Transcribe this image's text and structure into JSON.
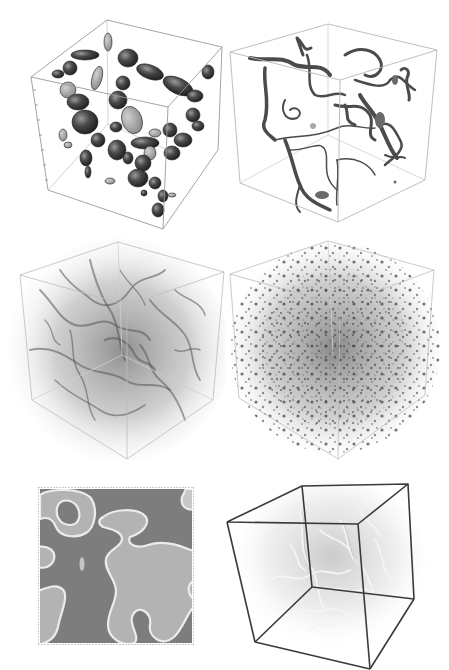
{
  "figure": {
    "background": "#ffffff",
    "panels": [
      {
        "id": "a",
        "kind": "3d-isosurface-blobs",
        "description": "Isosurfaces of localized blob structures inside a wireframe cube",
        "edge_color": "#9a9a9a",
        "fill_color": "#3a3a3a"
      },
      {
        "id": "b",
        "kind": "3d-isosurface-filaments",
        "description": "Tube-like filament network inside a wireframe cube",
        "edge_color": "#b0b0b0",
        "fill_color": "#4a4a4a"
      },
      {
        "id": "c",
        "kind": "3d-volume-render-web",
        "description": "Diffuse volume rendering of a web-like network inside a wireframe cube",
        "edge_color": "#bdbdbd",
        "fill_color": "#6a6a6a"
      },
      {
        "id": "d",
        "kind": "3d-volume-render-speckle",
        "description": "Speckled volume rendering of small clumps inside a wireframe cube",
        "edge_color": "#bdbdbd",
        "fill_color": "#4f4f4f"
      },
      {
        "id": "e",
        "kind": "2d-slice",
        "description": "2D cross-section showing light domains with bright walls on a darker background",
        "dark_color": "#7a7a7a",
        "light_color": "#b3b3b3",
        "wall_color": "#e6e6e6"
      },
      {
        "id": "f",
        "kind": "3d-volume-render-strings",
        "description": "Faint string network volume rendering inside a bold wireframe cube",
        "edge_color": "#3a3a3a",
        "fill_color": "#cfcfcf"
      }
    ]
  }
}
